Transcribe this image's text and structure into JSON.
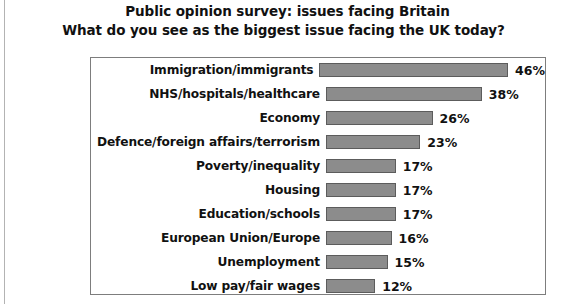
{
  "title": {
    "line1": "Public opinion survey: issues facing Britain",
    "line2": "What do you see as the biggest issue facing the UK today?"
  },
  "chart_data": {
    "type": "bar",
    "orientation": "horizontal",
    "title": "Public opinion survey: issues facing Britain",
    "subtitle": "What do you see as the biggest issue facing the UK today?",
    "xlabel": "",
    "ylabel": "",
    "xlim": [
      0,
      50
    ],
    "grid": false,
    "legend": null,
    "value_suffix": "%",
    "bar_color": "#8c8c8c",
    "bar_border_color": "#5c5c5c",
    "panel_border_color": "#7d7d7d",
    "background": "#ffffff",
    "categories": [
      "Immigration/immigrants",
      "NHS/hospitals/healthcare",
      "Economy",
      "Defence/foreign affairs/terrorism",
      "Poverty/inequality",
      "Housing",
      "Education/schools",
      "European Union/Europe",
      "Unemployment",
      "Low pay/fair wages"
    ],
    "values": [
      46,
      38,
      26,
      23,
      17,
      17,
      17,
      16,
      15,
      12
    ],
    "value_labels": [
      "46%",
      "38%",
      "26%",
      "23%",
      "17%",
      "17%",
      "17%",
      "16%",
      "15%",
      "12%"
    ],
    "rows": [
      {
        "label": "Immigration/immigrants",
        "value": 46,
        "value_label": "46%"
      },
      {
        "label": "NHS/hospitals/healthcare",
        "value": 38,
        "value_label": "38%"
      },
      {
        "label": "Economy",
        "value": 26,
        "value_label": "26%"
      },
      {
        "label": "Defence/foreign affairs/terrorism",
        "value": 23,
        "value_label": "23%"
      },
      {
        "label": "Poverty/inequality",
        "value": 17,
        "value_label": "17%"
      },
      {
        "label": "Housing",
        "value": 17,
        "value_label": "17%"
      },
      {
        "label": "Education/schools",
        "value": 17,
        "value_label": "17%"
      },
      {
        "label": "European Union/Europe",
        "value": 16,
        "value_label": "16%"
      },
      {
        "label": "Unemployment",
        "value": 15,
        "value_label": "15%"
      },
      {
        "label": "Low pay/fair wages",
        "value": 12,
        "value_label": "12%"
      }
    ]
  }
}
